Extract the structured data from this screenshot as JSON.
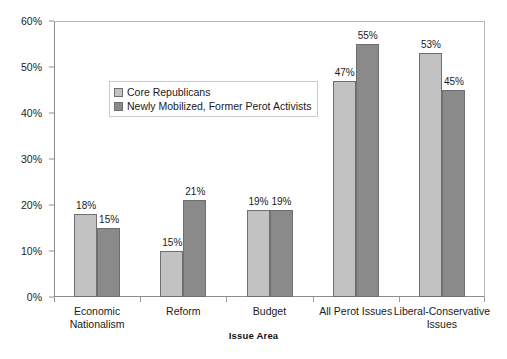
{
  "chart_data": {
    "type": "bar",
    "title": "",
    "xlabel": "Issue Area",
    "ylabel": "",
    "ylim": [
      0,
      60
    ],
    "grid": false,
    "legend_position": "inside-upper-left",
    "categories": [
      "Economic Nationalism",
      "Reform",
      "Budget",
      "All Perot Issues",
      "Liberal-Conservative Issues"
    ],
    "category_lines": [
      [
        "Economic",
        "Nationalism"
      ],
      [
        "Reform"
      ],
      [
        "Budget"
      ],
      [
        "All Perot Issues"
      ],
      [
        "Liberal-Conservative",
        "Issues"
      ]
    ],
    "ytick_labels": [
      "0%",
      "10%",
      "20%",
      "30%",
      "40%",
      "50%",
      "60%"
    ],
    "ytick_values": [
      0,
      10,
      20,
      30,
      40,
      50,
      60
    ],
    "series": [
      {
        "name": "Core Republicans",
        "color": "#c2c2c2",
        "values": [
          18,
          10,
          19,
          47,
          53
        ],
        "labels": [
          "18%",
          "15%",
          "19%",
          "47%",
          "53%"
        ]
      },
      {
        "name": "Newly Mobilized, Former Perot Activists",
        "color": "#8a8a8a",
        "values": [
          15,
          21,
          19,
          55,
          45
        ],
        "labels": [
          "15%",
          "21%",
          "19%",
          "55%",
          "45%"
        ]
      }
    ],
    "data_labels": {
      "Economic Nationalism": [
        "18%",
        "15%"
      ],
      "Reform": [
        "10%",
        "21%"
      ],
      "Budget": [
        "19%",
        "19%"
      ],
      "All Perot Issues": [
        "47%",
        "55%"
      ],
      "Liberal-Conservative Issues": [
        "53%",
        "45%"
      ]
    }
  },
  "legend": {
    "entries": [
      {
        "label": "Core Republicans",
        "color": "#c2c2c2"
      },
      {
        "label": "Newly Mobilized, Former Perot Activists",
        "color": "#8a8a8a"
      }
    ]
  },
  "axis": {
    "x_title": "Issue Area"
  }
}
